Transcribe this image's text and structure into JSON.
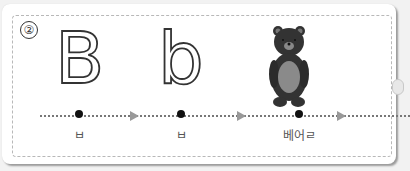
{
  "card": {
    "number": "②",
    "items": [
      {
        "glyph": "B",
        "label": "ㅂ"
      },
      {
        "glyph": "b",
        "label": "ㅂ"
      },
      {
        "image": "bear-icon",
        "label": "베어ㄹ"
      }
    ]
  }
}
